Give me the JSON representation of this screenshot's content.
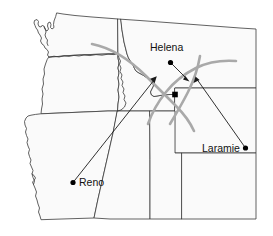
{
  "map": {
    "title": "Western United States station vector map",
    "background_color": "#ffffff",
    "land_fill_color": "#fafafa",
    "border_color": "#3a3a3a",
    "flow_color": "#a9a9a9",
    "vector_color": "#1a1a1a",
    "cities": [
      {
        "name": "Helena",
        "label": "Helena",
        "label_x": 150,
        "label_y": 50,
        "dot_x": 170.5,
        "dot_y": 62.5
      },
      {
        "name": "Laramie",
        "label": "Laramie",
        "label_x": 200,
        "label_y": 152,
        "dot_x": 245.5,
        "dot_y": 148.0
      },
      {
        "name": "Reno",
        "label": "Reno",
        "label_x": 79,
        "label_y": 187,
        "dot_x": 73.0,
        "dot_y": 182.5
      }
    ],
    "vectors": [
      {
        "name": "helena-vector",
        "from_x": 170.5,
        "from_y": 62.5,
        "to_x": 188.0,
        "to_y": 80.0
      },
      {
        "name": "laramie-vector",
        "from_x": 245.5,
        "from_y": 148.0,
        "to_x": 196.0,
        "to_y": 78.0
      },
      {
        "name": "reno-vector",
        "from_x": 73.0,
        "from_y": 182.5,
        "to_x": 156.0,
        "to_y": 77.5
      }
    ],
    "flow_curves": [
      {
        "name": "northern-flow-curve"
      },
      {
        "name": "eastern-flow-curve"
      },
      {
        "name": "southern-flow-curve"
      }
    ],
    "station_marker": {
      "name": "central-station",
      "x": 175.0,
      "y": 94.5
    }
  }
}
